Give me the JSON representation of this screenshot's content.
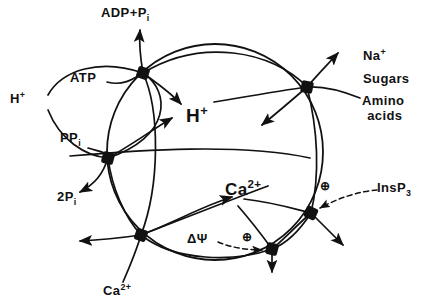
{
  "diagram": {
    "stroke_color": "#111111",
    "background_color": "#ffffff",
    "membrane": {
      "name": "main-membrane-circle",
      "cx": 215,
      "cy": 152,
      "r": 108
    },
    "labels": {
      "adp_pi": {
        "main": "ADP+P",
        "sub": "i"
      },
      "atp": {
        "main": "ATP"
      },
      "h_plus_left": {
        "main": "H",
        "sup": "+"
      },
      "ppi": {
        "main": "PP",
        "sub": "i"
      },
      "two_pi": {
        "main": "2P",
        "sub": "i"
      },
      "h_plus_center": {
        "main": "H",
        "sup": "+"
      },
      "na_plus": {
        "main": "Na",
        "sup": "+"
      },
      "sugars": {
        "main": "Sugars"
      },
      "amino": {
        "main": "Amino"
      },
      "acids": {
        "main": "acids"
      },
      "ca_center": {
        "main": "Ca",
        "sup": "2+"
      },
      "ca_bottom": {
        "main": "Ca",
        "sup": "2+"
      },
      "delta_psi": {
        "main": "ΔΨ"
      },
      "insp3": {
        "main": "InsP",
        "sub": "3"
      },
      "plus_circle_insp3": {
        "main": "⊕"
      },
      "plus_circle_psi": {
        "main": "⊕"
      }
    },
    "nodes": [
      {
        "name": "transporter-atpase-top",
        "x": 143,
        "y": 73
      },
      {
        "name": "transporter-ppase-left",
        "x": 108,
        "y": 158
      },
      {
        "name": "transporter-antiport-bottom-left",
        "x": 141,
        "y": 235
      },
      {
        "name": "transporter-symport-right",
        "x": 307,
        "y": 87
      },
      {
        "name": "transporter-insp3-channel",
        "x": 311,
        "y": 213
      },
      {
        "name": "transporter-voltage-channel",
        "x": 272,
        "y": 249
      }
    ]
  }
}
